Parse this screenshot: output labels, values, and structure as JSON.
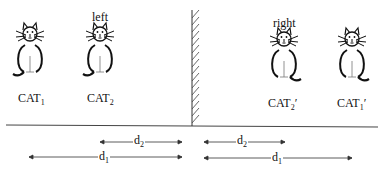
{
  "diagram": {
    "type": "mirror-reflection",
    "side_labels": {
      "left": "left",
      "right": "right"
    },
    "cats": [
      {
        "id": "cat1",
        "label": "CAT",
        "subscript": "1",
        "prime": "",
        "side": "left",
        "facing": "normal"
      },
      {
        "id": "cat2",
        "label": "CAT",
        "subscript": "2",
        "prime": "",
        "side": "left",
        "facing": "normal"
      },
      {
        "id": "cat2p",
        "label": "CAT",
        "subscript": "2",
        "prime": "′",
        "side": "right",
        "facing": "mirrored"
      },
      {
        "id": "cat1p",
        "label": "CAT",
        "subscript": "1",
        "prime": "′",
        "side": "right",
        "facing": "mirrored"
      }
    ],
    "distances": [
      {
        "label": "d",
        "subscript": "2",
        "side": "left"
      },
      {
        "label": "d",
        "subscript": "1",
        "side": "left"
      },
      {
        "label": "d",
        "subscript": "2",
        "side": "right"
      },
      {
        "label": "d",
        "subscript": "1",
        "side": "right"
      }
    ],
    "colors": {
      "stroke": "#111111",
      "line": "#444444",
      "background": "#ffffff"
    }
  }
}
